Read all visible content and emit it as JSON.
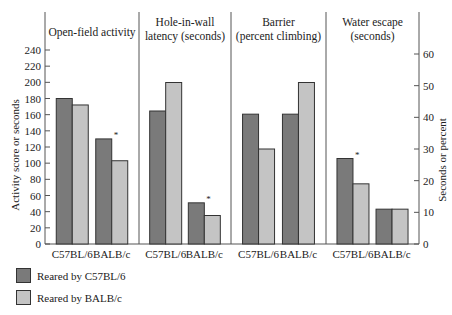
{
  "chart_data": {
    "type": "bar",
    "title": "",
    "panels": [
      {
        "title": [
          "Open-field activity"
        ],
        "axis": "left",
        "categories": [
          "C57BL/6",
          "BALB/c"
        ],
        "series": [
          {
            "name": "Reared by C57BL/6",
            "values": [
              180,
              130
            ]
          },
          {
            "name": "Reared by BALB/c",
            "values": [
              172,
              103
            ]
          }
        ],
        "asterisk": [
          false,
          true
        ]
      },
      {
        "title": [
          "Hole-in-wall",
          "latency (seconds)"
        ],
        "axis": "right",
        "categories": [
          "C57BL/6",
          "BALB/c"
        ],
        "series": [
          {
            "name": "Reared by C57BL/6",
            "values": [
              42,
              13
            ]
          },
          {
            "name": "Reared by BALB/c",
            "values": [
              51,
              9
            ]
          }
        ],
        "asterisk": [
          false,
          true
        ]
      },
      {
        "title": [
          "Barrier",
          "(percent climbing)"
        ],
        "axis": "right",
        "categories": [
          "C57BL/6",
          "BALB/c"
        ],
        "series": [
          {
            "name": "Reared by C57BL/6",
            "values": [
              41,
              41
            ]
          },
          {
            "name": "Reared by BALB/c",
            "values": [
              30,
              51
            ]
          }
        ],
        "asterisk": [
          false,
          false
        ]
      },
      {
        "title": [
          "Water escape",
          "(seconds)"
        ],
        "axis": "right",
        "categories": [
          "C57BL/6",
          "BALB/c"
        ],
        "series": [
          {
            "name": "Reared by C57BL/6",
            "values": [
              27,
              11
            ]
          },
          {
            "name": "Reared by BALB/c",
            "values": [
              19,
              11
            ]
          }
        ],
        "asterisk": [
          true,
          false
        ]
      }
    ],
    "left_axis": {
      "label": "Activity score or seconds",
      "ylim": [
        0,
        240
      ],
      "ticks": [
        0,
        20,
        40,
        60,
        80,
        100,
        120,
        140,
        160,
        180,
        200,
        220,
        240
      ]
    },
    "right_axis": {
      "label": "Seconds or percent",
      "ylim": [
        0,
        60
      ],
      "ticks": [
        0,
        10,
        20,
        30,
        40,
        50,
        60
      ]
    },
    "legend": {
      "position": "bottom-left",
      "entries": [
        {
          "label": "Reared by C57BL/6",
          "color": "#7a7a7a"
        },
        {
          "label": "Reared by BALB/c",
          "color": "#c4c4c4"
        }
      ]
    },
    "grid": false
  }
}
